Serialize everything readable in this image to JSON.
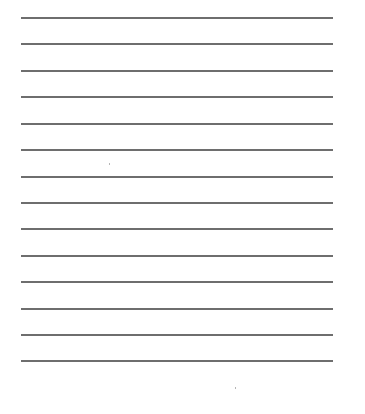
{
  "page": {
    "type": "lined-paper",
    "background_color": "#ffffff",
    "rule_color": "#6e6e6e",
    "rule_count": 14,
    "rule_left": 21,
    "rule_right": 333,
    "rule_positions_y": [
      17,
      43,
      70,
      96,
      123,
      149,
      176,
      202,
      228,
      255,
      281,
      308,
      334,
      360
    ],
    "text": ""
  }
}
